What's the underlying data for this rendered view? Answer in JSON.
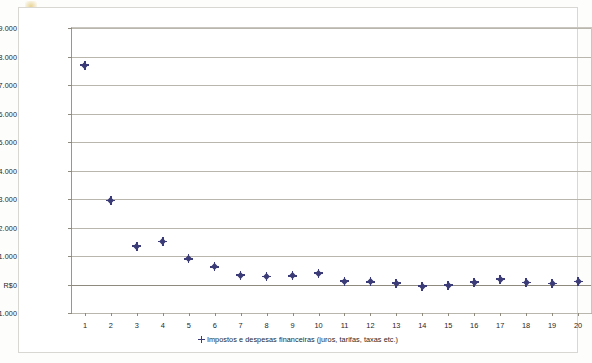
{
  "chart_data": {
    "type": "scatter",
    "title": "",
    "xlabel": "",
    "ylabel": "",
    "grid": true,
    "legend_position": "bottom",
    "x": [
      1,
      2,
      3,
      4,
      5,
      6,
      7,
      8,
      9,
      10,
      11,
      12,
      13,
      14,
      15,
      16,
      17,
      18,
      19,
      20
    ],
    "categories": [
      "1",
      "2",
      "3",
      "4",
      "5",
      "6",
      "7",
      "8",
      "9",
      "10",
      "11",
      "12",
      "13",
      "14",
      "15",
      "16",
      "17",
      "18",
      "19",
      "20"
    ],
    "series": [
      {
        "name": "Impostos e despesas financeiras (juros, tarifas, taxas etc.)",
        "color": "#3b3b78",
        "values": [
          7700,
          2950,
          1350,
          1500,
          900,
          620,
          330,
          280,
          300,
          400,
          120,
          90,
          50,
          -60,
          -30,
          80,
          180,
          60,
          30,
          100
        ]
      }
    ],
    "ylim": [
      -1000,
      9000
    ],
    "ytick_values": [
      9000,
      8000,
      7000,
      6000,
      5000,
      4000,
      3000,
      2000,
      1000,
      0,
      -1000
    ],
    "ytick_labels": [
      "R$9.000",
      "R$8.000",
      "R$7.000",
      "R$6.000",
      "R$5.000",
      "R$4.000",
      "R$3.000",
      "R$2.000",
      "R$1.000",
      "R$0",
      "-R$1.000"
    ],
    "xtick_labels": [
      "1",
      "2",
      "3",
      "4",
      "5",
      "6",
      "7",
      "8",
      "9",
      "10",
      "11",
      "12",
      "13",
      "14",
      "15",
      "16",
      "17",
      "18",
      "19",
      "20"
    ]
  },
  "legend": {
    "entries": [
      {
        "label": "Impostos e despesas financeiras (juros, tarifas, taxas etc.)",
        "marker": "diamond-marker",
        "color": "#3b3b78"
      }
    ]
  },
  "colors": {
    "marker": "#3b3b78",
    "gridline": "#b9b6ad",
    "axis": "#8e8a7e",
    "frame": "#d9d7d2",
    "background": "#ffffff"
  }
}
